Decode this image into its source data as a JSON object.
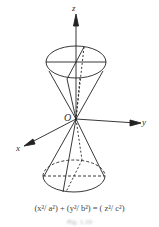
{
  "figure": {
    "axis_labels": {
      "z": "z",
      "y": "y",
      "x": "x",
      "origin": "O"
    },
    "equation": "(x²/ a²) + (y²/ b²) = ( z²/ c²)",
    "caption": "Fig. 1.10"
  }
}
